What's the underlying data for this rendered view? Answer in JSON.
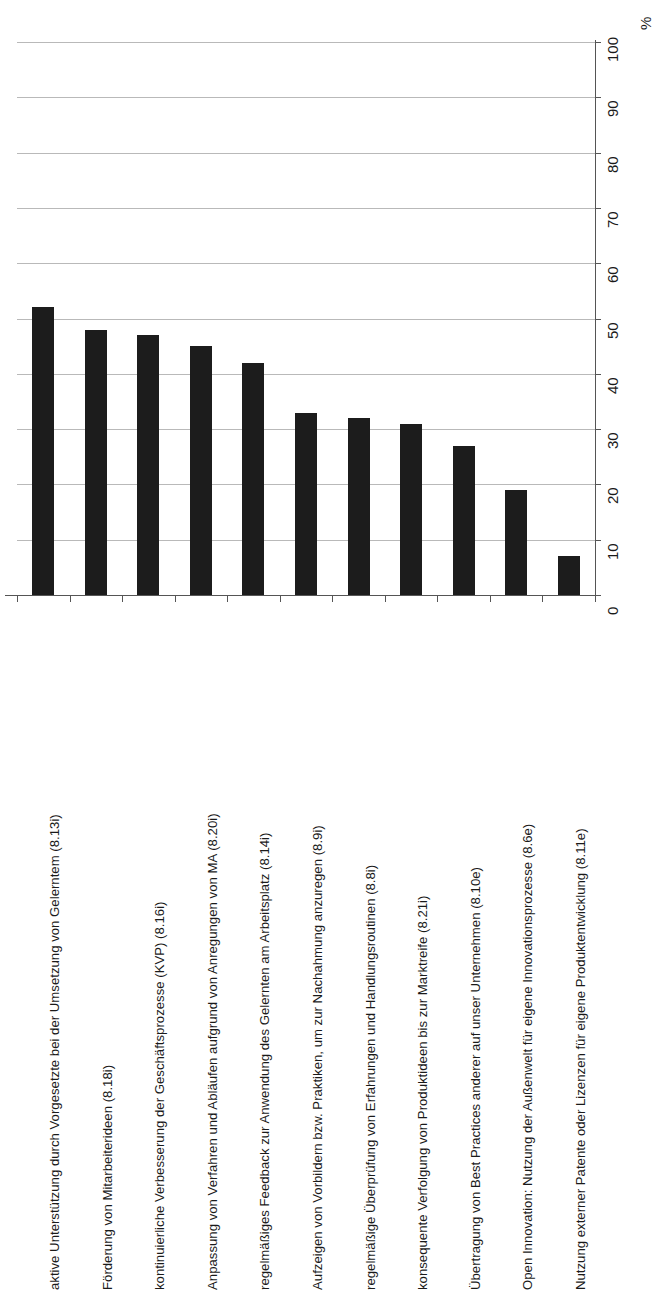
{
  "chart_data": {
    "type": "bar",
    "title": "",
    "xlabel": "",
    "ylabel": "",
    "unit_label": "%",
    "orientation": "vertical-bars-rotated-labels",
    "grid": true,
    "legend": false,
    "ylim": [
      0,
      100
    ],
    "yticks": [
      "0",
      "10",
      "20",
      "30",
      "40",
      "50",
      "60",
      "70",
      "80",
      "90",
      "100"
    ],
    "categories": [
      "aktive Unterstützung durch Vorgesetzte bei der Umsetzung von Gelerntem (8.13i)",
      "Förderung von Mitarbeiterideen (8.18i)",
      "kontinuierliche Verbesserung der Geschäftsprozesse (KVP) (8.16i)",
      "Anpassung von Verfahren und Abläufen aufgrund von Anregungen von MA (8.20i)",
      "regelmäßiges Feedback zur Anwendung des Gelernten am Arbeitsplatz (8.14i)",
      "Aufzeigen von Vorbildern bzw. Praktiken, um zur Nachahmung anzuregen (8.9i)",
      "regelmäßige Überprüfung von Erfahrungen und Handlungsroutinen (8.8i)",
      "konsequente Verfolgung von Produktideen bis zur Marktreife (8.21i)",
      "Übertragung von Best Practices anderer auf unser Unternehmen (8.10e)",
      "Open Innovation: Nutzung der Außenwelt für eigene Innovationsprozesse (8.6e)",
      "Nutzung externer Patente oder Lizenzen für eigene Produktentwicklung (8.11e)"
    ],
    "values": [
      52,
      48,
      47,
      45,
      42,
      33,
      32,
      31,
      27,
      19,
      7
    ],
    "colors": {
      "bar": "#1c1c1c",
      "grid": "#b9b9b9",
      "axis": "#555555",
      "text": "#1a1a1a",
      "background": "#ffffff"
    }
  }
}
